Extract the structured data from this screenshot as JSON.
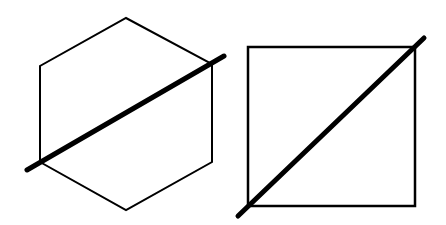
{
  "diagram": {
    "background": "#ffffff",
    "stroke_color": "#000000",
    "shapes": [
      {
        "name": "hexagon",
        "points": [
          [
            126,
            18
          ],
          [
            212,
            64
          ],
          [
            212,
            162
          ],
          [
            126,
            210
          ],
          [
            40,
            162
          ],
          [
            40,
            66
          ]
        ],
        "stroke_width": 2,
        "bisector": {
          "x1": 27,
          "y1": 170,
          "x2": 224,
          "y2": 56,
          "stroke_width": 5
        }
      },
      {
        "name": "square",
        "rect": {
          "x": 248,
          "y": 47,
          "width": 167,
          "height": 159
        },
        "stroke_width": 2.5,
        "bisector": {
          "x1": 238,
          "y1": 216,
          "x2": 424,
          "y2": 38,
          "stroke_width": 5
        }
      }
    ]
  }
}
